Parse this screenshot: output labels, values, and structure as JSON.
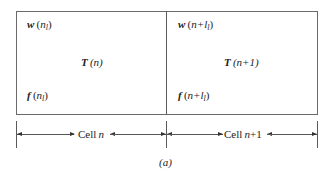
{
  "figure": {
    "caption": "(a)",
    "cells": [
      {
        "top_label": {
          "sym": "w",
          "arg_pre": "(",
          "arg_var": "n",
          "arg_sub": "l",
          "arg_post": ")"
        },
        "center_label": {
          "sym": "T",
          "arg": "(n)"
        },
        "bottom_label": {
          "sym": "f",
          "arg_pre": "(",
          "arg_var": "n",
          "arg_sub": "l",
          "arg_post": ")"
        },
        "dimension_label": {
          "word": "Cell",
          "var": "n",
          "suffix": ""
        }
      },
      {
        "top_label": {
          "sym": "w",
          "arg_pre": "(",
          "arg_var": "n+l",
          "arg_sub": "l",
          "arg_post": ")"
        },
        "center_label": {
          "sym": "T",
          "arg": "(n+1)"
        },
        "bottom_label": {
          "sym": "f",
          "arg_pre": "(",
          "arg_var": "n+l",
          "arg_sub": "l",
          "arg_post": ")"
        },
        "dimension_label": {
          "word": "Cell",
          "var": "n",
          "suffix": "+1"
        }
      }
    ]
  }
}
